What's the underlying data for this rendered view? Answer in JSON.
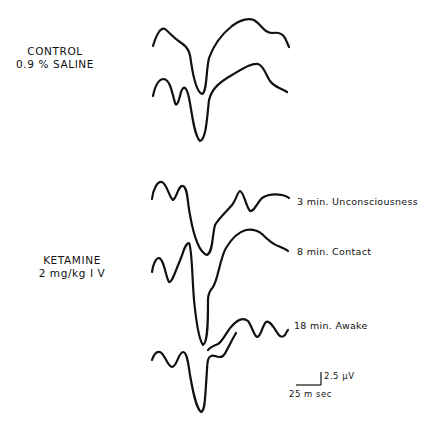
{
  "figure": {
    "groups": [
      {
        "id": "control",
        "label_line1": "CONTROL",
        "label_line2": "0.9 % SALINE"
      },
      {
        "id": "ketamine",
        "label_line1": "KETAMINE",
        "label_line2": "2 mg/kg  I V"
      }
    ],
    "traces": [
      {
        "group": "control",
        "condition": ""
      },
      {
        "group": "control",
        "condition": ""
      },
      {
        "group": "ketamine",
        "condition": "3 min. Unconsciousness"
      },
      {
        "group": "ketamine",
        "condition": "8 min. Contact"
      },
      {
        "group": "ketamine",
        "condition": "18 min. Awake"
      },
      {
        "group": "ketamine",
        "condition": ""
      }
    ],
    "scale_bar": {
      "amplitude_label": "2.5 µV",
      "time_label": "25 m sec"
    },
    "colors": {
      "trace": "#111111",
      "background": "#ffffff"
    }
  }
}
